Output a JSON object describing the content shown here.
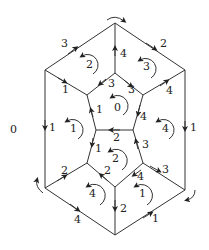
{
  "diagram": {
    "outer_label": "0",
    "edge_labels": [
      {
        "id": "e-top-left",
        "text": "3",
        "x": 61,
        "y": 47
      },
      {
        "id": "e-top-right",
        "text": "2",
        "x": 160,
        "y": 47
      },
      {
        "id": "e-top-mid",
        "text": "4",
        "x": 120,
        "y": 57
      },
      {
        "id": "e-ul-inner",
        "text": "1",
        "x": 62,
        "y": 93
      },
      {
        "id": "e-ur-inner",
        "text": "4",
        "x": 166,
        "y": 94
      },
      {
        "id": "e-pent-tl",
        "text": "3",
        "x": 108,
        "y": 87
      },
      {
        "id": "e-pent-tr",
        "text": "3",
        "x": 128,
        "y": 93
      },
      {
        "id": "e-pent-l",
        "text": "1",
        "x": 96,
        "y": 113
      },
      {
        "id": "e-pent-r",
        "text": "4",
        "x": 140,
        "y": 118
      },
      {
        "id": "e-left",
        "text": "1",
        "x": 50,
        "y": 130
      },
      {
        "id": "e-right",
        "text": "1",
        "x": 191,
        "y": 130
      },
      {
        "id": "e-mid",
        "text": "2",
        "x": 113,
        "y": 141
      },
      {
        "id": "e-lower-l",
        "text": "1",
        "x": 95,
        "y": 152
      },
      {
        "id": "e-lower-r",
        "text": "3",
        "x": 142,
        "y": 148
      },
      {
        "id": "e-ll-inner",
        "text": "2",
        "x": 61,
        "y": 174
      },
      {
        "id": "e-lr-inner",
        "text": "3",
        "x": 163,
        "y": 173
      },
      {
        "id": "e-low-pl",
        "text": "2",
        "x": 104,
        "y": 174
      },
      {
        "id": "e-low-pr",
        "text": "4",
        "x": 137,
        "y": 180
      },
      {
        "id": "e-bottom-mid",
        "text": "2",
        "x": 120,
        "y": 212
      },
      {
        "id": "e-bottom-left",
        "text": "4",
        "x": 76,
        "y": 223
      },
      {
        "id": "e-bottom-right",
        "text": "1",
        "x": 153,
        "y": 222
      }
    ],
    "face_labels": [
      {
        "id": "face-top-left",
        "text": "2",
        "x": 87,
        "y": 64
      },
      {
        "id": "face-top-right",
        "text": "3",
        "x": 145,
        "y": 68
      },
      {
        "id": "face-center-top",
        "text": "0",
        "x": 116,
        "y": 108
      },
      {
        "id": "face-left",
        "text": "1",
        "x": 72,
        "y": 130
      },
      {
        "id": "face-right",
        "text": "4",
        "x": 163,
        "y": 130
      },
      {
        "id": "face-center-low",
        "text": "2",
        "x": 114,
        "y": 161
      },
      {
        "id": "face-bottom-left",
        "text": "4",
        "x": 91,
        "y": 196
      },
      {
        "id": "face-bottom-right",
        "text": "1",
        "x": 141,
        "y": 196
      }
    ]
  }
}
